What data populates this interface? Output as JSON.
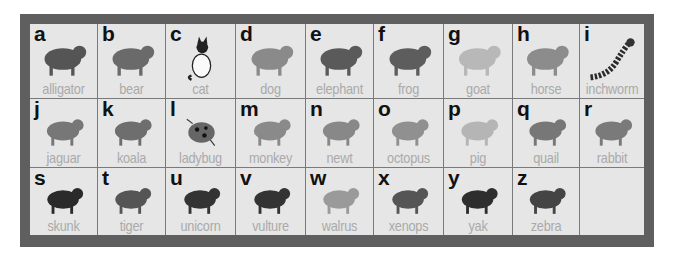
{
  "colors": {
    "frame": "#5f5f5f",
    "cell": "#e6e6e6",
    "letter": "#111111",
    "label": "#aaaaaa"
  },
  "cells": [
    {
      "letter": "a",
      "label": "alligator",
      "icon": "alligator-icon",
      "tone": "#555"
    },
    {
      "letter": "b",
      "label": "bear",
      "icon": "bear-icon",
      "tone": "#6a6a6a"
    },
    {
      "letter": "c",
      "label": "cat",
      "icon": "cat-icon",
      "tone": "#222"
    },
    {
      "letter": "d",
      "label": "dog",
      "icon": "dog-icon",
      "tone": "#8a8a8a"
    },
    {
      "letter": "e",
      "label": "elephant",
      "icon": "elephant-icon",
      "tone": "#5a5a5a"
    },
    {
      "letter": "f",
      "label": "frog",
      "icon": "frog-icon",
      "tone": "#5d5d5d"
    },
    {
      "letter": "g",
      "label": "goat",
      "icon": "goat-icon",
      "tone": "#b8b8b8"
    },
    {
      "letter": "h",
      "label": "horse",
      "icon": "horse-icon",
      "tone": "#8c8c8c"
    },
    {
      "letter": "i",
      "label": "inchworm",
      "icon": "inchworm-icon",
      "tone": "#2a2a2a"
    },
    {
      "letter": "j",
      "label": "jaguar",
      "icon": "jaguar-icon",
      "tone": "#777"
    },
    {
      "letter": "k",
      "label": "koala",
      "icon": "koala-icon",
      "tone": "#6e6e6e"
    },
    {
      "letter": "l",
      "label": "ladybug",
      "icon": "ladybug-icon",
      "tone": "#444"
    },
    {
      "letter": "m",
      "label": "monkey",
      "icon": "monkey-icon",
      "tone": "#8a8a8a"
    },
    {
      "letter": "n",
      "label": "newt",
      "icon": "newt-icon",
      "tone": "#888"
    },
    {
      "letter": "o",
      "label": "octopus",
      "icon": "octopus-icon",
      "tone": "#909090"
    },
    {
      "letter": "p",
      "label": "pig",
      "icon": "pig-icon",
      "tone": "#b5b5b5"
    },
    {
      "letter": "q",
      "label": "quail",
      "icon": "quail-icon",
      "tone": "#777"
    },
    {
      "letter": "r",
      "label": "rabbit",
      "icon": "rabbit-icon",
      "tone": "#7a7a7a"
    },
    {
      "letter": "s",
      "label": "skunk",
      "icon": "skunk-icon",
      "tone": "#2a2a2a"
    },
    {
      "letter": "t",
      "label": "tiger",
      "icon": "tiger-icon",
      "tone": "#555"
    },
    {
      "letter": "u",
      "label": "unicorn",
      "icon": "unicorn-icon",
      "tone": "#333"
    },
    {
      "letter": "v",
      "label": "vulture",
      "icon": "vulture-icon",
      "tone": "#333"
    },
    {
      "letter": "w",
      "label": "walrus",
      "icon": "walrus-icon",
      "tone": "#9a9a9a"
    },
    {
      "letter": "x",
      "label": "xenops",
      "icon": "xenops-icon",
      "tone": "#555"
    },
    {
      "letter": "y",
      "label": "yak",
      "icon": "yak-icon",
      "tone": "#2e2e2e"
    },
    {
      "letter": "z",
      "label": "zebra",
      "icon": "zebra-icon",
      "tone": "#444"
    },
    {
      "letter": "",
      "label": "",
      "icon": "",
      "tone": ""
    }
  ]
}
